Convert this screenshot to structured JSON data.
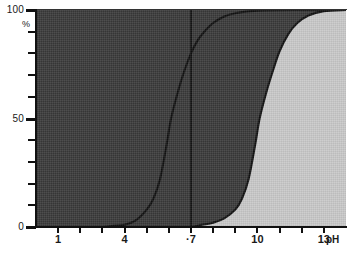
{
  "chart_data": {
    "type": "line",
    "title": "",
    "xlabel": "pH",
    "ylabel": "%",
    "xlim": [
      0,
      14
    ],
    "ylim": [
      0,
      100
    ],
    "grid": false,
    "legend_position": "none",
    "x_ticks": [
      1,
      2,
      3,
      4,
      5,
      6,
      7,
      8,
      9,
      10,
      11,
      12,
      13
    ],
    "x_tick_labels": [
      "1",
      "",
      "",
      "4",
      "",
      "",
      "·7",
      "",
      "",
      "10",
      "",
      "",
      "13"
    ],
    "y_ticks": [
      0,
      10,
      20,
      30,
      40,
      50,
      60,
      70,
      80,
      90,
      100
    ],
    "y_tick_labels": [
      "0",
      "",
      "",
      "",
      "",
      "50",
      "",
      "",
      "",
      "",
      "100"
    ],
    "annotations": [
      {
        "name": "neutral-ph-line",
        "type": "vline",
        "x": 7,
        "label": "·7"
      }
    ],
    "series": [
      {
        "name": "curve-1",
        "comment": "first sigmoid, midpoint near pH 6.1",
        "x": [
          0,
          1,
          2,
          3,
          3.5,
          4,
          4.5,
          5,
          5.3,
          5.6,
          5.9,
          6.1,
          6.4,
          6.7,
          7,
          7.3,
          7.6,
          8,
          8.5,
          9,
          10,
          12,
          14
        ],
        "values": [
          0,
          0,
          0,
          0,
          0.5,
          1,
          3,
          8,
          13,
          22,
          38,
          50,
          62,
          72,
          80,
          86,
          90,
          94,
          97,
          98.5,
          99.7,
          100,
          100
        ]
      },
      {
        "name": "curve-2",
        "comment": "second sigmoid, midpoint near pH 10.1",
        "x": [
          0,
          4,
          6,
          7,
          7.5,
          8,
          8.5,
          9,
          9.3,
          9.6,
          9.9,
          10.1,
          10.4,
          10.7,
          11,
          11.4,
          11.8,
          12.3,
          13,
          14
        ],
        "values": [
          0,
          0,
          0,
          0,
          1,
          2,
          4,
          8,
          13,
          22,
          38,
          50,
          62,
          72,
          81,
          89,
          94,
          97.5,
          99.5,
          100
        ]
      }
    ],
    "regions": [
      {
        "name": "region-acidic",
        "color": "#c9c9c9",
        "description": "left region below curve-1"
      },
      {
        "name": "region-neutral",
        "color": "#9a9a9a",
        "description": "middle region between curve-1 and curve-2"
      },
      {
        "name": "region-basic",
        "color": "#3a3a3a",
        "description": "right region right of curve-2"
      }
    ],
    "colors": {
      "light_fill": "#c9c9c9",
      "mid_fill": "#9a9a9a",
      "dark_fill": "#3a3a3a",
      "curve_stroke": "#111111",
      "axis": "#111111",
      "background": "#ffffff"
    }
  }
}
